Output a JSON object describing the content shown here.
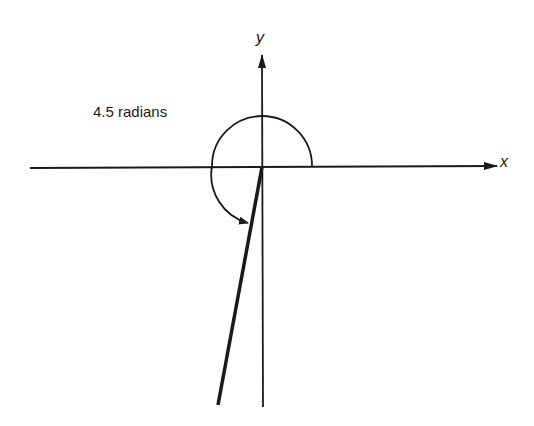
{
  "diagram": {
    "angle_label": "4.5 radians",
    "x_axis_label": "x",
    "y_axis_label": "y",
    "angle_radians": 4.5,
    "stroke_color": "#1a1a1a"
  }
}
